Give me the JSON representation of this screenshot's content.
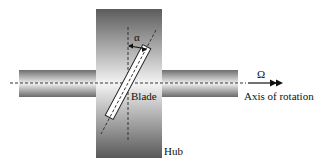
{
  "diagram": {
    "labels": {
      "alpha": "α",
      "omega": "Ω",
      "axis": "Axis of rotation",
      "blade": "Blade",
      "hub": "Hub"
    },
    "colors": {
      "hub_dark": "#5a5a5a",
      "hub_light": "#f2f2f2",
      "shaft_dark": "#6a6a6a",
      "shaft_light": "#eeeeee",
      "line": "#333333",
      "blade_fill": "#ffffff"
    }
  }
}
